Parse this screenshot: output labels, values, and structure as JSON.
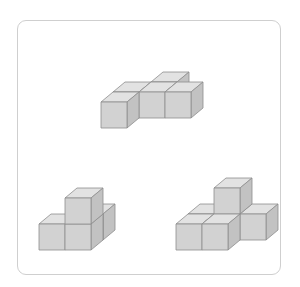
{
  "figure": {
    "colors": {
      "frame_border": "#cfcfcf",
      "cube_front": "#d2d2d2",
      "cube_top": "#e2e2e2",
      "cube_side": "#c2c2c2",
      "cube_edge": "#8e8e8e"
    },
    "shapes": [
      {
        "id": "top",
        "name": "cross-shape",
        "cube_count": 5,
        "layers": 1
      },
      {
        "id": "bottom-left",
        "name": "l-stack-shape",
        "cube_count": 4,
        "layers": 2
      },
      {
        "id": "bottom-right",
        "name": "step-shape",
        "cube_count": 6,
        "layers": 2
      }
    ]
  }
}
